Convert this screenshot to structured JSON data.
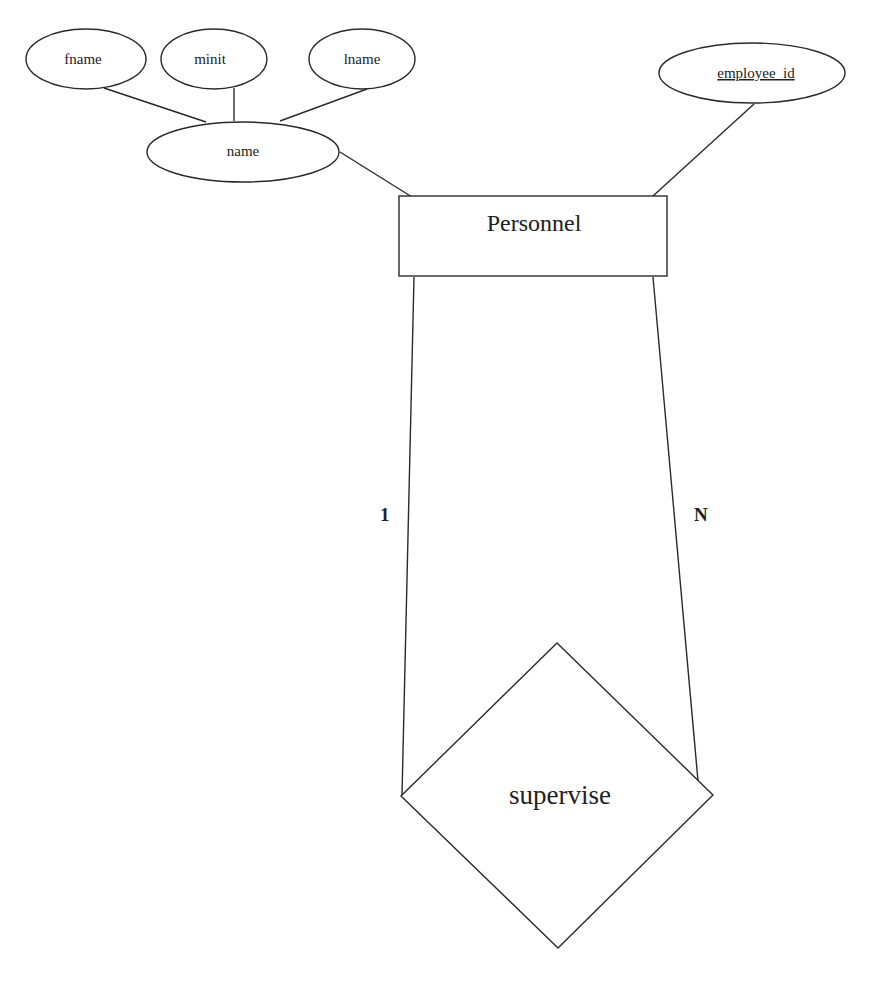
{
  "diagram": {
    "type": "er-diagram",
    "entity": {
      "id": "personnel",
      "label": "Personnel"
    },
    "attributes": [
      {
        "id": "fname",
        "label": "fname",
        "parent": "name",
        "key": false
      },
      {
        "id": "minit",
        "label": "minit",
        "parent": "name",
        "key": false
      },
      {
        "id": "lname",
        "label": "lname",
        "parent": "name",
        "key": false
      },
      {
        "id": "name",
        "label": "name",
        "parent": "personnel",
        "composite": true,
        "key": false
      },
      {
        "id": "employee_id",
        "label": "employee_id",
        "parent": "personnel",
        "key": true
      }
    ],
    "relationship": {
      "id": "supervise",
      "label": "supervise",
      "recursive": true,
      "cardinality": {
        "left": "1",
        "right": "N"
      }
    }
  }
}
